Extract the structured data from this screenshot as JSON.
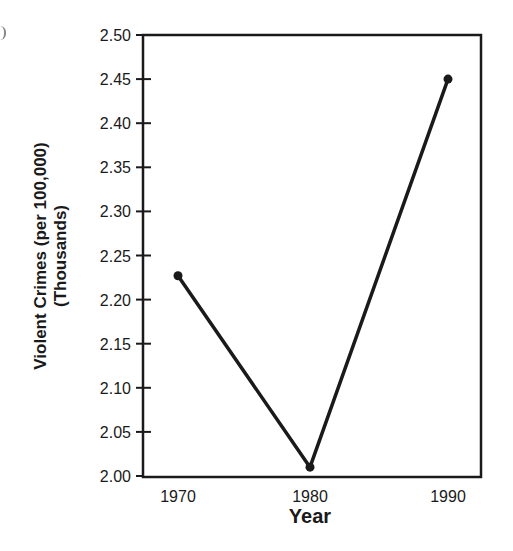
{
  "chart_data": {
    "type": "line",
    "title": "",
    "xlabel": "Year",
    "ylabel": "Violent Crimes (per 100,000)",
    "ylabel_line2": "(Thousands)",
    "categories": [
      "1970",
      "1980",
      "1990"
    ],
    "x": [
      1970,
      1980,
      1990
    ],
    "values": [
      2.227,
      2.01,
      2.45
    ],
    "series": [
      {
        "name": "Violent Crimes",
        "values": [
          2.227,
          2.01,
          2.45
        ]
      }
    ],
    "ylim": [
      2.0,
      2.5
    ],
    "yticks": [
      "2.00",
      "2.05",
      "2.10",
      "2.15",
      "2.20",
      "2.25",
      "2.30",
      "2.35",
      "2.40",
      "2.45",
      "2.50"
    ],
    "xticks": [
      "1970",
      "1980",
      "1990"
    ],
    "grid": false,
    "legend": null,
    "line_color": "#1a1a1a"
  }
}
